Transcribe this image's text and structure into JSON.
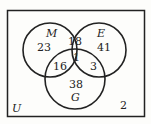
{
  "diagram": {
    "type": "venn-3",
    "universe_label": "U",
    "sets": [
      {
        "name": "M",
        "only": "23"
      },
      {
        "name": "E",
        "only": "41"
      },
      {
        "name": "G",
        "only": "38"
      }
    ],
    "regions": {
      "M_only": "23",
      "E_only": "41",
      "G_only": "38",
      "M_and_E_only": "18",
      "M_and_G_only": "16",
      "E_and_G_only": "3",
      "M_and_E_and_G": "1",
      "outside": "2"
    }
  }
}
